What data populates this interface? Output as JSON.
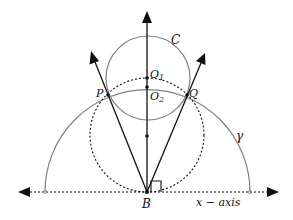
{
  "diagram": {
    "labels": {
      "C": "C",
      "O1": "O",
      "O1_sub": "1",
      "O2": "O",
      "O2_sub": "2",
      "P": "P",
      "Q": "Q",
      "gamma": "γ",
      "B": "B",
      "x_axis": "x − axis"
    },
    "colors": {
      "ink": "#111111",
      "circle": "#808080"
    }
  }
}
